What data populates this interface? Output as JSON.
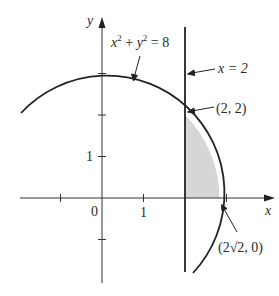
{
  "diagram": {
    "type": "region between circle and vertical line",
    "axes": {
      "x_label": "x",
      "y_label": "y",
      "origin_label": "0",
      "x_tick_label": "1",
      "y_tick_label": "1",
      "x_ticks": [
        -1,
        1,
        3
      ],
      "y_ticks": [
        -1,
        1,
        2,
        3
      ]
    },
    "curves": {
      "circle": {
        "equation_label_x": "x",
        "equation_label_y": "y",
        "sup": "2",
        "rest": " = 8",
        "plus": " + ",
        "radius_squared": 8
      },
      "line": {
        "label": "x = 2",
        "x": 2
      }
    },
    "points": {
      "intersection": "(2, 2)",
      "x_intercept_pre": "(2",
      "x_intercept_sqrt": "√2",
      "x_intercept_post": ", 0)"
    },
    "colors": {
      "stroke": "#222222",
      "shade": "#d6d6d6"
    }
  }
}
